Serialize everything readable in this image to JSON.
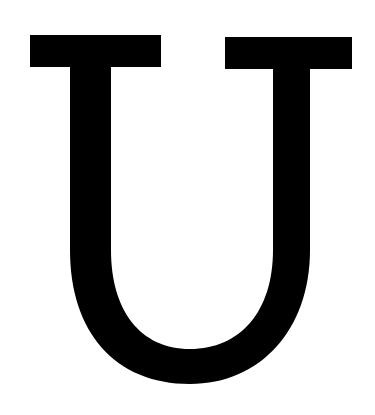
{
  "glyph": {
    "character": "U",
    "color": "#000000",
    "background": "#ffffff"
  }
}
